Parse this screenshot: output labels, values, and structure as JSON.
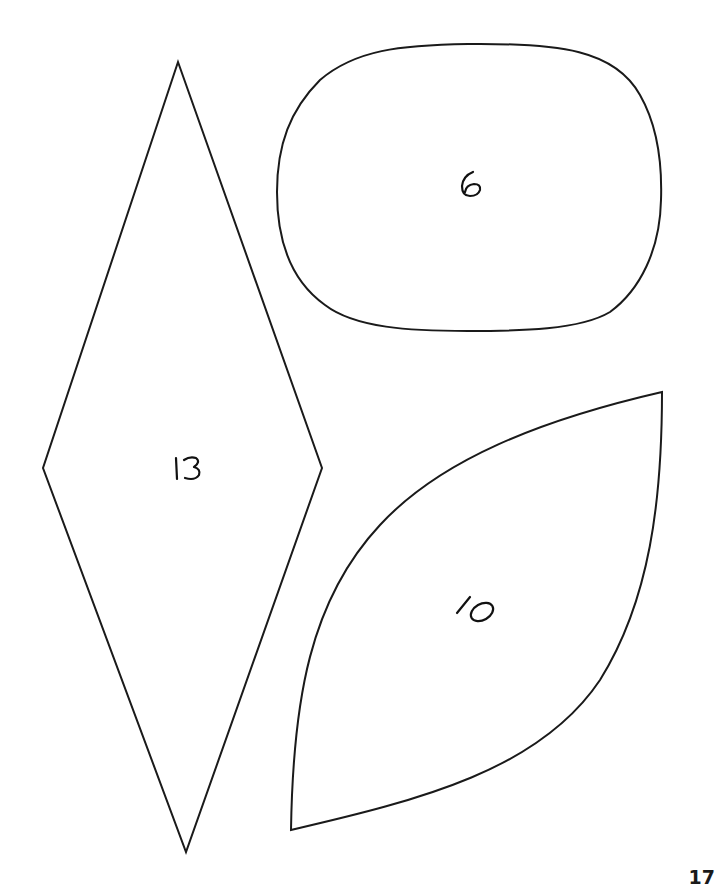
{
  "page": {
    "number": "17",
    "background": "#ffffff",
    "stroke_color": "#1a1a1a"
  },
  "shapes": [
    {
      "name": "diamond",
      "label": "13",
      "kind": "rhombus"
    },
    {
      "name": "oval",
      "label": "6",
      "kind": "rounded-oval"
    },
    {
      "name": "leaf",
      "label": "10",
      "kind": "pointed-leaf"
    }
  ]
}
